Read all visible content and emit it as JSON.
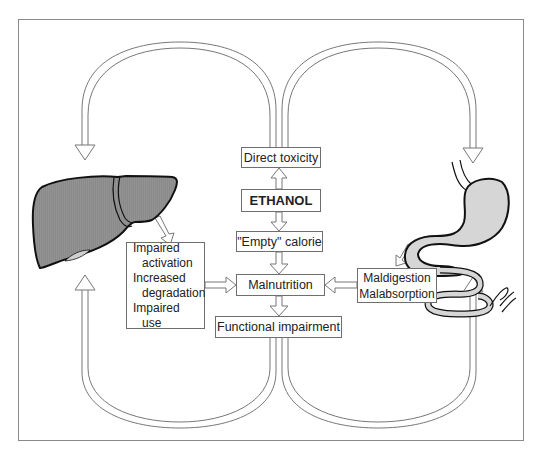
{
  "diagram": {
    "center_chain": {
      "direct_toxicity": "Direct toxicity",
      "ethanol": "ETHANOL",
      "empty_calorie": "\"Empty\" calorie",
      "malnutrition": "Malnutrition",
      "functional_impairment": "Functional impairment"
    },
    "liver_effects": {
      "lines": [
        "Impaired",
        "activation",
        "Increased",
        "degradation",
        "Impaired",
        "use"
      ]
    },
    "gut_effects": {
      "lines": [
        "Maldigestion",
        "Malabsorption"
      ]
    },
    "organs": {
      "left": "liver",
      "right": "stomach and intestine"
    },
    "colors": {
      "organ_fill_liver": "#8c8c8c",
      "organ_fill_stomach": "#d9d9d9",
      "outline": "#1a1a1a",
      "frame": "#8a8a8a",
      "arrow_stroke": "#777777"
    }
  }
}
